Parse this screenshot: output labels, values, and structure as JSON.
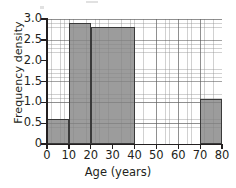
{
  "chart_data": {
    "type": "bar",
    "title": "",
    "subtitle": "",
    "xlabel": "Age (years)",
    "ylabel": "Frequency density",
    "xlim": [
      0,
      80
    ],
    "ylim": [
      0,
      3.0
    ],
    "grid": true,
    "legend": null,
    "x_ticks": [
      "0",
      "10",
      "20",
      "30",
      "40",
      "50",
      "60",
      "70",
      "80"
    ],
    "x_tick_values": [
      0,
      10,
      20,
      30,
      40,
      50,
      60,
      70,
      80
    ],
    "y_ticks": [
      "0",
      "0.5",
      "1.0",
      "1.5",
      "2.0",
      "2.5",
      "3.0"
    ],
    "y_tick_values": [
      0,
      0.5,
      1.0,
      1.5,
      2.0,
      2.5,
      3.0
    ],
    "bars": [
      {
        "label": "0-10",
        "x_start": 0,
        "x_end": 10,
        "value": 0.6
      },
      {
        "label": "10-20",
        "x_start": 10,
        "x_end": 20,
        "value": 2.9
      },
      {
        "label": "20-40",
        "x_start": 20,
        "x_end": 40,
        "value": 2.8
      },
      {
        "label": "70-80",
        "x_start": 70,
        "x_end": 80,
        "value": 1.07
      }
    ],
    "categories": [
      "0-10",
      "10-20",
      "20-40",
      "70-80"
    ],
    "values": [
      0.6,
      2.9,
      2.8,
      1.07
    ],
    "colors": {
      "bar_fill": "#838383",
      "bar_edge": "#3a3a3a",
      "axis": "#231f20",
      "grid_major": "#5a5a5a",
      "grid_minor": "#8c8c8c",
      "background": "#ffffff"
    }
  }
}
